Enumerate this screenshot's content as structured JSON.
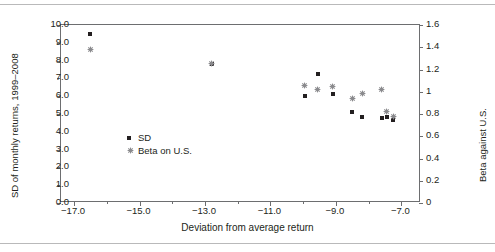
{
  "chart_data": {
    "type": "scatter",
    "title": "",
    "xlabel": "Deviation from average return",
    "ylabel": "SD of monthly returns, 1999–2008",
    "y2label": "Beta against U.S.",
    "xlim": [
      -17.4,
      -6.4
    ],
    "ylim": [
      0.0,
      10.0
    ],
    "y2lim": [
      0.0,
      1.6
    ],
    "grid": false,
    "legend_position": "inside-left",
    "xticks": [
      "−17.0",
      "−15.0",
      "−13.0",
      "−11.0",
      "−9.0",
      "−7.0"
    ],
    "xtick_values": [
      -17.0,
      -15.0,
      -13.0,
      -11.0,
      -9.0,
      -7.0
    ],
    "xminor_values": [
      -16.0,
      -14.0,
      -12.0,
      -10.0,
      -8.0
    ],
    "yticks": [
      "0.0",
      "1.0",
      "2.0",
      "3.0",
      "4.0",
      "5.0",
      "6.0",
      "7.0",
      "8.0",
      "9.0",
      "10.0"
    ],
    "ytick_values": [
      0,
      1,
      2,
      3,
      4,
      5,
      6,
      7,
      8,
      9,
      10
    ],
    "y2ticks": [
      "0",
      "0.2",
      "0.4",
      "0.6",
      "0.8",
      "1",
      "1.2",
      "1.4",
      "1.6"
    ],
    "y2tick_values": [
      0,
      0.2,
      0.4,
      0.6,
      0.8,
      1.0,
      1.2,
      1.4,
      1.6
    ],
    "x": [
      -16.5,
      -12.8,
      -9.95,
      -9.55,
      -9.1,
      -8.5,
      -8.2,
      -7.6,
      -7.45,
      -7.25
    ],
    "series": [
      {
        "name": "SD",
        "marker": "square",
        "color": "#231f20",
        "values": [
          9.5,
          7.8,
          6.0,
          7.25,
          6.1,
          5.1,
          4.85,
          4.8,
          4.85,
          4.65
        ]
      },
      {
        "name": "Beta on U.S.",
        "marker": "asterisk",
        "color": "#8a8a8d",
        "values": [
          1.38,
          1.25,
          1.06,
          1.02,
          1.05,
          0.94,
          0.98,
          1.02,
          0.82,
          0.78
        ]
      }
    ]
  },
  "legend": {
    "items": [
      {
        "label": "SD"
      },
      {
        "label": "Beta on U.S."
      }
    ]
  },
  "colors": {
    "sd_marker": "#231f20",
    "beta_marker": "#8a8a8d",
    "axis": "#6d6e70",
    "rule": "#b9b9ba",
    "text": "#231f20"
  }
}
